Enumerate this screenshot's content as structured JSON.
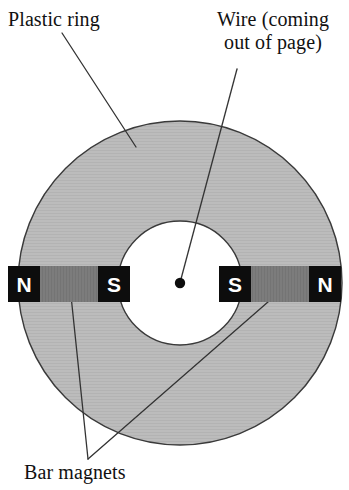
{
  "figure": {
    "canvas": {
      "width": 349,
      "height": 490,
      "background": "#ffffff"
    }
  },
  "labels": {
    "plastic_ring": "Plastic ring",
    "wire_line1": "Wire (coming",
    "wire_line2": "out of page)",
    "bar_magnets": "Bar magnets"
  },
  "ring": {
    "name": "plastic-ring",
    "center_x": 180,
    "center_y": 283,
    "outer_radius": 162,
    "inner_radius": 62,
    "fill": "#b9b9b9",
    "stroke": "#3a3a3a",
    "stroke_width": 1.4
  },
  "wire": {
    "name": "wire-out-of-page",
    "dot_x": 180,
    "dot_y": 283,
    "dot_radius": 5.2,
    "color": "#0d0d0d"
  },
  "magnets": [
    {
      "name": "bar-magnet-left",
      "x": 8,
      "y": 266,
      "width": 122,
      "height": 36,
      "body_fill": "#7b7b7b",
      "pole_fill": "#0d0d0d",
      "pole_width": 32,
      "left_pole": "N",
      "right_pole": "S"
    },
    {
      "name": "bar-magnet-right",
      "x": 219,
      "y": 266,
      "width": 122,
      "height": 36,
      "body_fill": "#7b7b7b",
      "pole_fill": "#0d0d0d",
      "pole_width": 32,
      "left_pole": "S",
      "right_pole": "N"
    }
  ],
  "leaders": [
    {
      "name": "leader-plastic-ring",
      "x1": 62,
      "y1": 33,
      "x2": 136,
      "y2": 147,
      "color": "#333333"
    },
    {
      "name": "leader-wire",
      "x1": 237,
      "y1": 69,
      "x2": 181,
      "y2": 279,
      "color": "#333333"
    },
    {
      "name": "leader-bar-magnet-left",
      "x1": 88,
      "y1": 459,
      "x2": 70,
      "y2": 286,
      "color": "#333333"
    },
    {
      "name": "leader-bar-magnet-right",
      "x1": 88,
      "y1": 459,
      "x2": 284,
      "y2": 288,
      "color": "#333333"
    }
  ]
}
